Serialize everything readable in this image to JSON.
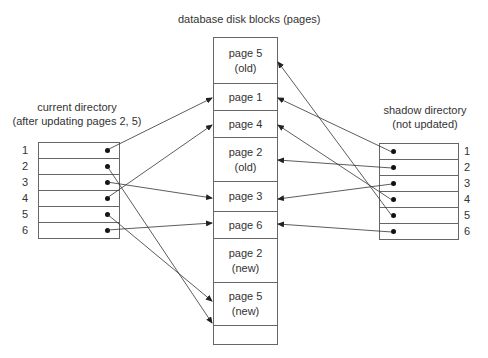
{
  "title": "database disk blocks (pages)",
  "current_directory": {
    "label_line1": "current directory",
    "label_line2": "(after updating pages 2, 5)",
    "rows": [
      "1",
      "2",
      "3",
      "4",
      "5",
      "6"
    ]
  },
  "shadow_directory": {
    "label_line1": "shadow directory",
    "label_line2": "(not updated)",
    "rows": [
      "1",
      "2",
      "3",
      "4",
      "5",
      "6"
    ]
  },
  "blocks": [
    {
      "line1": "page 5",
      "line2": "(old)"
    },
    {
      "line1": "page 1",
      "line2": ""
    },
    {
      "line1": "page 4",
      "line2": ""
    },
    {
      "line1": "page 2",
      "line2": "(old)"
    },
    {
      "line1": "page 3",
      "line2": ""
    },
    {
      "line1": "page 6",
      "line2": ""
    },
    {
      "line1": "page 2",
      "line2": "(new)"
    },
    {
      "line1": "page 5",
      "line2": "(new)"
    },
    {
      "line1": "",
      "line2": ""
    }
  ]
}
